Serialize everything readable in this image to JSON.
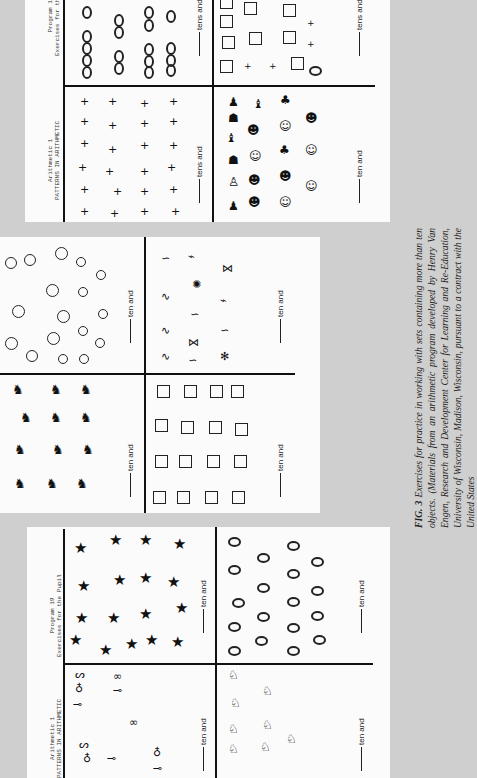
{
  "page": {
    "orientation": "rotated-90-cw",
    "background_color": "#cfcfcf",
    "panel_color": "#fbfbfb"
  },
  "worksheets": {
    "header": {
      "left_line1": "Arithmetic 1",
      "left_line2": "PATTERNS IN ARITHMETIC",
      "right_line1": "Program 19",
      "right_line2": "Exercises for the Pupil"
    },
    "top": {
      "quadrants": [
        {
          "id": "top-left",
          "content": "zeros",
          "count_visible": 16,
          "blank_label": "tens and"
        },
        {
          "id": "top-right",
          "content": "squares-plus-signs-oval",
          "blank_label": "tens and"
        },
        {
          "id": "bottom-left",
          "content": "plus-signs",
          "count_visible": 24,
          "blank_label": "tens and"
        },
        {
          "id": "bottom-right",
          "content": "creature-pictures",
          "blank_label": "ten and"
        }
      ]
    },
    "middle": {
      "quadrants": [
        {
          "id": "top-left",
          "content": "circles",
          "count_visible": 19,
          "blank_label": "ten and"
        },
        {
          "id": "top-right",
          "content": "fish-and-worms",
          "count_visible": 14,
          "blank_label": "ten and"
        },
        {
          "id": "bottom-left",
          "content": "dogs",
          "count_visible": 12,
          "blank_label": "ten and"
        },
        {
          "id": "bottom-right",
          "content": "squares",
          "count_visible": 16,
          "blank_label": "ten and"
        }
      ]
    },
    "bottom": {
      "quadrants": [
        {
          "id": "top-left",
          "content": "stars",
          "count_visible": 17,
          "blank_label": "ten and"
        },
        {
          "id": "top-right",
          "content": "ovals",
          "count_visible": 17,
          "blank_label": "ten and"
        },
        {
          "id": "bottom-left",
          "content": "balloons",
          "blank_label": "ten and"
        },
        {
          "id": "bottom-right",
          "content": "birds",
          "blank_label": "ten and"
        }
      ]
    }
  },
  "caption": {
    "label": "FIG. 3",
    "text_italic_1": "Exercises for practice in working with sets containing more than ten objects. (Materials from an arithmetic program developed by Henry Van Engen, Research and Development Center for Learning and Re-Education, University of Wisconsin, Madison, Wisconsin, pursuant to a contract with the United States"
  }
}
